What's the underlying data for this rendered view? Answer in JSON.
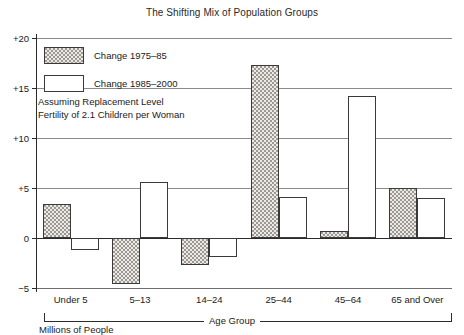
{
  "chart_data": {
    "type": "bar",
    "title": "The Shifting Mix of Population Groups",
    "xlabel": "Age Group",
    "ylabel": "Millions of People",
    "ylim": [
      -5,
      20
    ],
    "yticks": [
      {
        "value": 20,
        "label": "+20"
      },
      {
        "value": 15,
        "label": "+15"
      },
      {
        "value": 10,
        "label": "+10"
      },
      {
        "value": 5,
        "label": "+5"
      },
      {
        "value": 0,
        "label": "0"
      },
      {
        "value": -5,
        "label": "−5"
      }
    ],
    "grid": true,
    "legend_position": "upper-left",
    "categories": [
      "Under 5",
      "5–13",
      "14–24",
      "25–44",
      "45–64",
      "65 and Over"
    ],
    "series": [
      {
        "name": "Change 1975–85",
        "style": "hatched",
        "values": [
          3.4,
          -4.6,
          -2.7,
          17.3,
          0.7,
          5.0
        ]
      },
      {
        "name": "Change 1985–2000",
        "style": "open",
        "values": [
          -1.2,
          5.6,
          -1.9,
          4.1,
          14.2,
          4.0
        ]
      }
    ],
    "annotations": [
      "Assuming Replacement Level",
      "Fertility of 2.1 Children per Woman"
    ]
  },
  "colors": {
    "axis": "#2b2b2b",
    "grid": "#8a8a8a",
    "bar_outline": "#3a3a3a",
    "hatch_fill": "#eceae6",
    "open_fill": "#ffffff",
    "text": "#1a1a1a"
  }
}
